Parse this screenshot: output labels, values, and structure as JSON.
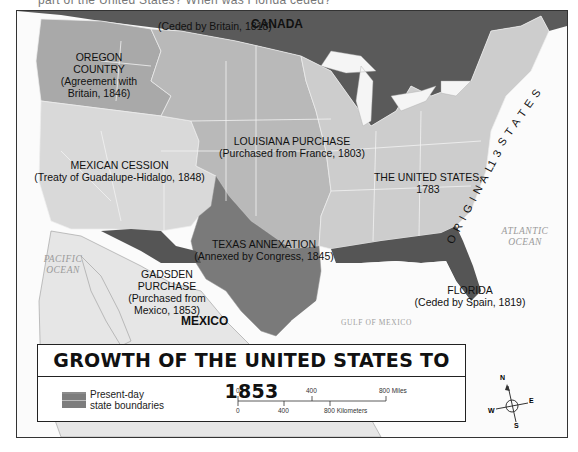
{
  "header": {
    "partial_text": "part of the United States? When was Florida ceded?"
  },
  "map": {
    "title": "GROWTH OF THE UNITED STATES TO 1853",
    "regions": [
      {
        "id": "canada",
        "label": "CANADA",
        "color": "#5a5a5a"
      },
      {
        "id": "ceded-britain-1818",
        "label": "(Ceded by Britain, 1818)",
        "color": "#5a5a5a"
      },
      {
        "id": "oregon",
        "name": "OREGON",
        "name2": "COUNTRY",
        "detail1": "(Agreement with",
        "detail2": "Britain, 1846)",
        "color": "#a9a9a9"
      },
      {
        "id": "louisiana",
        "name": "LOUISIANA PURCHASE",
        "detail": "(Purchased from France, 1803)",
        "color": "#b8b8b8"
      },
      {
        "id": "mexican-cession",
        "name": "MEXICAN CESSION",
        "detail": "(Treaty of Guadalupe-Hidalgo, 1848)",
        "color": "#d6d6d6"
      },
      {
        "id": "us-1783",
        "name": "THE UNITED STATES,",
        "detail": "1783",
        "color": "#cdcdcd"
      },
      {
        "id": "original-13",
        "label_a": "ORIGINAL",
        "label_b": "13",
        "label_c": "STATES"
      },
      {
        "id": "texas",
        "name": "TEXAS ANNEXATION",
        "detail": "(Annexed by Congress, 1845)",
        "color": "#7a7a7a"
      },
      {
        "id": "gadsden",
        "name": "GADSDEN",
        "name2": "PURCHASE",
        "detail1": "(Purchased from",
        "detail2": "Mexico, 1853)",
        "color": "#555555"
      },
      {
        "id": "florida",
        "name": "FLORIDA",
        "detail": "(Ceded by Spain, 1819)",
        "color": "#555555"
      },
      {
        "id": "mexico",
        "label": "MEXICO",
        "color": "#e3e3e3"
      }
    ],
    "water": {
      "pacific_1": "PACIFIC",
      "pacific_2": "OCEAN",
      "atlantic_1": "ATLANTIC",
      "atlantic_2": "OCEAN",
      "gulf": "GULF OF MEXICO"
    }
  },
  "legend": {
    "swatch_label_1": "Present-day",
    "swatch_label_2": "state boundaries",
    "scale": {
      "miles_ticks": [
        "0",
        "400",
        "800 Miles"
      ],
      "km_ticks": [
        "0",
        "400",
        "800 Kilometers"
      ]
    }
  },
  "compass": {
    "n": "N",
    "s": "S",
    "e": "E",
    "w": "W"
  }
}
